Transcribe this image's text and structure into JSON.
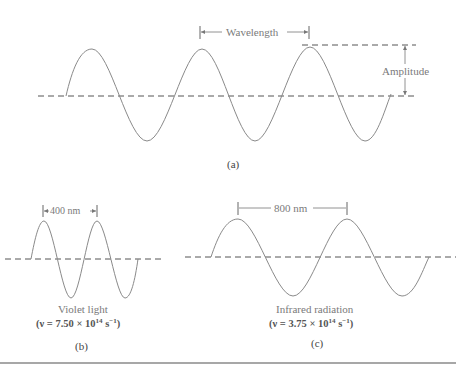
{
  "panel_a": {
    "caption": "(a)",
    "wavelength_label": "Wavelength",
    "amplitude_label": "Amplitude"
  },
  "panel_b": {
    "caption": "(b)",
    "span_label": "400 nm",
    "name": "Violet light",
    "freq_prefix": "(ν = 7.50 × 10",
    "freq_exp": "14",
    "freq_unit": " s",
    "freq_unit_exp": "−1",
    "freq_suffix": ")"
  },
  "panel_c": {
    "caption": "(c)",
    "span_label": "800 nm",
    "name": "Infrared radiation",
    "freq_prefix": "(ν = 3.75 × 10",
    "freq_exp": "14",
    "freq_unit": " s",
    "freq_unit_exp": "−1",
    "freq_suffix": ")"
  },
  "colors": {
    "line": "#8a8a8a",
    "dash": "#555555",
    "rule": "#9a9a9a"
  }
}
